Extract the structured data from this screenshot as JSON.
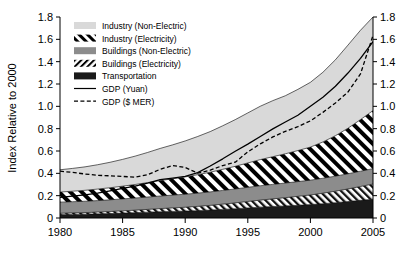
{
  "chart_data": {
    "type": "area",
    "title": "",
    "subtitle": "",
    "xlabel": "",
    "ylabel": "Index Relative to 2000",
    "xlim": [
      1980,
      2005
    ],
    "ylim": [
      0,
      1.8
    ],
    "grid": false,
    "legend_position": "top-left-inside",
    "stacked": true,
    "x_ticks": [
      "1980",
      "1985",
      "1990",
      "1995",
      "2000",
      "2005"
    ],
    "x_tick_values": [
      1980,
      1985,
      1990,
      1995,
      2000,
      2005
    ],
    "y_ticks": [
      "0",
      "0.2",
      "0.4",
      "0.6",
      "0.8",
      "1.0",
      "1.2",
      "1.4",
      "1.6",
      "1.8"
    ],
    "y_tick_values": [
      0,
      0.2,
      0.4,
      0.6,
      0.8,
      1.0,
      1.2,
      1.4,
      1.6,
      1.8
    ],
    "y_ticks_right": [
      "0",
      "0.2",
      "0.4",
      "0.6",
      "0.8",
      "1.0",
      "1.2",
      "1.4",
      "1.6",
      "1.8"
    ],
    "x": [
      1980,
      1981,
      1982,
      1983,
      1984,
      1985,
      1986,
      1987,
      1988,
      1989,
      1990,
      1991,
      1992,
      1993,
      1994,
      1995,
      1996,
      1997,
      1998,
      1999,
      2000,
      2001,
      2002,
      2003,
      2004,
      2005
    ],
    "series": [
      {
        "name": "Transportation",
        "key": "transportation",
        "style": "solid-fill",
        "color": "#1a1a1a",
        "values": [
          0.03,
          0.032,
          0.034,
          0.037,
          0.04,
          0.044,
          0.048,
          0.052,
          0.056,
          0.059,
          0.062,
          0.066,
          0.071,
          0.077,
          0.083,
          0.09,
          0.097,
          0.103,
          0.108,
          0.114,
          0.12,
          0.128,
          0.137,
          0.147,
          0.158,
          0.168
        ]
      },
      {
        "name": "Buildings (Electricity)",
        "key": "buildings_electricity",
        "style": "hatch-thin-diagonal",
        "color": "#f2f2f2",
        "values": [
          0.012,
          0.013,
          0.014,
          0.016,
          0.018,
          0.02,
          0.022,
          0.025,
          0.028,
          0.031,
          0.034,
          0.038,
          0.042,
          0.047,
          0.052,
          0.058,
          0.063,
          0.068,
          0.074,
          0.08,
          0.086,
          0.094,
          0.103,
          0.113,
          0.124,
          0.136
        ]
      },
      {
        "name": "Buildings (Non-Electric)",
        "key": "buildings_nonelectric",
        "style": "solid-fill",
        "color": "#8c8c8c",
        "values": [
          0.1,
          0.101,
          0.102,
          0.103,
          0.105,
          0.107,
          0.109,
          0.111,
          0.113,
          0.115,
          0.117,
          0.119,
          0.121,
          0.123,
          0.125,
          0.127,
          0.129,
          0.13,
          0.131,
          0.132,
          0.133,
          0.134,
          0.135,
          0.136,
          0.137,
          0.138
        ]
      },
      {
        "name": "Industry (Electricity)",
        "key": "industry_electricity",
        "style": "hatch-bold-diagonal",
        "color": "#ffffff",
        "values": [
          0.09,
          0.094,
          0.098,
          0.103,
          0.108,
          0.114,
          0.121,
          0.129,
          0.138,
          0.146,
          0.155,
          0.165,
          0.176,
          0.189,
          0.203,
          0.218,
          0.234,
          0.248,
          0.262,
          0.278,
          0.296,
          0.325,
          0.362,
          0.408,
          0.462,
          0.52
        ]
      },
      {
        "name": "Industry (Non-Electric)",
        "key": "industry_nonelectric",
        "style": "solid-fill",
        "color": "#d9d9d9",
        "values": [
          0.2,
          0.204,
          0.21,
          0.218,
          0.228,
          0.24,
          0.254,
          0.27,
          0.288,
          0.304,
          0.322,
          0.342,
          0.364,
          0.39,
          0.418,
          0.448,
          0.478,
          0.502,
          0.52,
          0.548,
          0.58,
          0.624,
          0.68,
          0.744,
          0.8,
          0.838
        ]
      }
    ],
    "lines": [
      {
        "name": "GDP (Yuan)",
        "key": "gdp_yuan",
        "style": "solid",
        "color": "#000000",
        "values": [
          0.185,
          0.196,
          0.208,
          0.222,
          0.243,
          0.266,
          0.285,
          0.312,
          0.344,
          0.358,
          0.372,
          0.406,
          0.466,
          0.53,
          0.598,
          0.662,
          0.73,
          0.798,
          0.86,
          0.92,
          1.0,
          1.082,
          1.18,
          1.298,
          1.43,
          1.58
        ]
      },
      {
        "name": "GDP ($ MER)",
        "key": "gdp_mer",
        "style": "dashed",
        "color": "#000000",
        "values": [
          0.42,
          0.408,
          0.394,
          0.382,
          0.378,
          0.372,
          0.366,
          0.388,
          0.436,
          0.47,
          0.452,
          0.402,
          0.428,
          0.47,
          0.5,
          0.592,
          0.664,
          0.726,
          0.776,
          0.818,
          0.87,
          0.946,
          1.03,
          1.128,
          1.29,
          1.635
        ]
      }
    ]
  },
  "legend": {
    "items": [
      {
        "label": "Industry (Non-Electric)",
        "swatch": "solid-light-gray"
      },
      {
        "label": "Industry (Electricity)",
        "swatch": "hatch-bold-diagonal"
      },
      {
        "label": "Buildings (Non-Electric)",
        "swatch": "solid-mid-gray"
      },
      {
        "label": "Buildings (Electricity)",
        "swatch": "hatch-thin-diagonal"
      },
      {
        "label": "Transportation",
        "swatch": "solid-black"
      },
      {
        "label": "GDP (Yuan)",
        "swatch": "line-solid"
      },
      {
        "label": "GDP ($ MER)",
        "swatch": "line-dashed"
      }
    ]
  },
  "colors": {
    "industry_nonelectric": "#d9d9d9",
    "buildings_nonelectric": "#8c8c8c",
    "transportation": "#1a1a1a",
    "axis": "#000000",
    "background": "#ffffff"
  }
}
